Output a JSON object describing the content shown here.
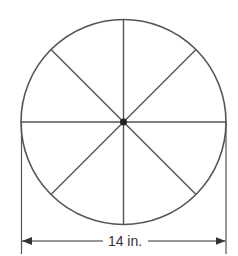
{
  "diagram": {
    "type": "circle-divided-into-sectors",
    "sectors": 8,
    "dimension_label": "14 in.",
    "colors": {
      "stroke": "#555555",
      "center_dot": "#222222",
      "text": "#333333",
      "background": "#ffffff"
    }
  }
}
